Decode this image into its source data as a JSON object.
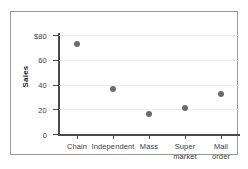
{
  "chart_data": {
    "type": "scatter",
    "title": "",
    "xlabel": "",
    "ylabel": "Sales",
    "categories": [
      "Chain",
      "Independent",
      "Mass",
      "Super market",
      "Mail order"
    ],
    "category_lines": [
      [
        "Chain"
      ],
      [
        "Independent"
      ],
      [
        "Mass"
      ],
      [
        "Super",
        "market"
      ],
      [
        "Mail",
        "order"
      ]
    ],
    "values": [
      73,
      36,
      16,
      21,
      32
    ],
    "ylim": [
      0,
      80
    ],
    "yticks": [
      0,
      20,
      40,
      60,
      80
    ],
    "ytick_labels": [
      "0",
      "20",
      "40",
      "60",
      "$80"
    ],
    "grid": true,
    "grid_axis": "y",
    "legend": "none",
    "marker_color": "#6b6b6b",
    "axis_color": "#4a4a4a",
    "grid_color": "#ececec",
    "frame_color": "#9a9a9a",
    "background": "#ffffff"
  }
}
